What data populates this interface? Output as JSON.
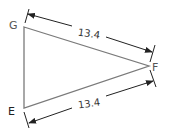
{
  "diagram": {
    "type": "triangle",
    "vertices": [
      {
        "label": "G",
        "x": 24,
        "y": 27
      },
      {
        "label": "F",
        "x": 149,
        "y": 66
      },
      {
        "label": "E",
        "x": 24,
        "y": 108
      }
    ],
    "dimensions": [
      {
        "side": "GF",
        "value": "13.4"
      },
      {
        "side": "EF",
        "value": "13.4"
      }
    ],
    "colors": {
      "triangle": "#7a7a7a",
      "dimension": "#222222"
    }
  }
}
